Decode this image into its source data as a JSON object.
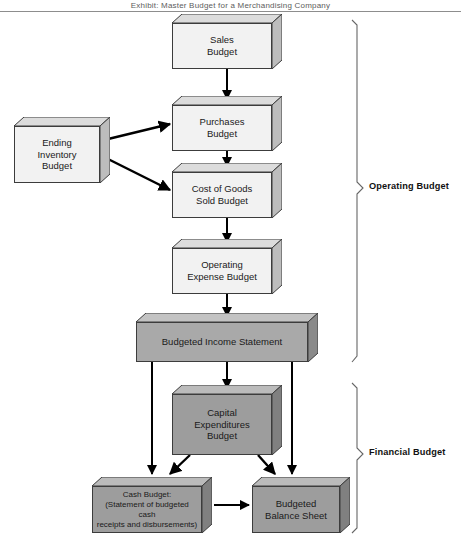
{
  "page": {
    "running_header": "Exhibit: Master Budget for a Merchandising Company"
  },
  "diagram": {
    "nodes": [
      {
        "id": "sales",
        "label": "Sales\nBudget",
        "lines": [
          "Sales",
          "Budget"
        ],
        "shade": "light",
        "x": 172,
        "y": 14,
        "w": 110,
        "h": 55
      },
      {
        "id": "purchases",
        "label": "Purchases\nBudget",
        "lines": [
          "Purchases",
          "Budget"
        ],
        "shade": "light",
        "x": 172,
        "y": 96,
        "w": 110,
        "h": 55
      },
      {
        "id": "ending_inv",
        "label": "Ending\nInventory\nBudget",
        "lines": [
          "Ending",
          "Inventory",
          "Budget"
        ],
        "shade": "light",
        "x": 14,
        "y": 117,
        "w": 96,
        "h": 66
      },
      {
        "id": "cogs",
        "label": "Cost of Goods\nSold Budget",
        "lines": [
          "Cost of Goods",
          "Sold Budget"
        ],
        "shade": "light",
        "x": 172,
        "y": 163,
        "w": 110,
        "h": 55
      },
      {
        "id": "op_expense",
        "label": "Operating\nExpense Budget",
        "lines": [
          "Operating",
          "Expense Budget"
        ],
        "shade": "light",
        "x": 172,
        "y": 239,
        "w": 110,
        "h": 55
      },
      {
        "id": "income_stmt",
        "label": "Budgeted Income Statement",
        "lines": [
          "Budgeted Income Statement"
        ],
        "shade": "mid",
        "x": 136,
        "y": 313,
        "w": 182,
        "h": 49
      },
      {
        "id": "capital_exp",
        "label": "Capital\nExpenditures\nBudget",
        "lines": [
          "Capital",
          "Expenditures",
          "Budget"
        ],
        "shade": "dark",
        "x": 172,
        "y": 385,
        "w": 110,
        "h": 70
      },
      {
        "id": "cash_budget",
        "label": "Cash Budget:\n(Statement of budgeted cash\nreceipts and disbursements)",
        "lines": [
          "Cash Budget:",
          "(Statement of budgeted cash",
          "receipts and disbursements)"
        ],
        "shade": "dark",
        "x": 92,
        "y": 477,
        "w": 120,
        "h": 56
      },
      {
        "id": "balance_sheet",
        "label": "Budgeted\nBalance Sheet",
        "lines": [
          "Budgeted",
          "Balance Sheet"
        ],
        "shade": "dark",
        "x": 252,
        "y": 477,
        "w": 98,
        "h": 56
      }
    ],
    "edges": [
      {
        "id": "sales-to-purchases",
        "from": "sales",
        "to": "purchases"
      },
      {
        "id": "endinv-to-purchases",
        "from": "ending_inv",
        "to": "purchases"
      },
      {
        "id": "endinv-to-cogs",
        "from": "ending_inv",
        "to": "cogs"
      },
      {
        "id": "purchases-to-cogs",
        "from": "purchases",
        "to": "cogs"
      },
      {
        "id": "cogs-to-opexpense",
        "from": "cogs",
        "to": "op_expense"
      },
      {
        "id": "opexpense-to-income",
        "from": "op_expense",
        "to": "income_stmt"
      },
      {
        "id": "income-to-cash",
        "from": "income_stmt",
        "to": "cash_budget"
      },
      {
        "id": "income-to-capital",
        "from": "income_stmt",
        "to": "capital_exp"
      },
      {
        "id": "income-to-balance",
        "from": "income_stmt",
        "to": "balance_sheet"
      },
      {
        "id": "capital-to-cash",
        "from": "capital_exp",
        "to": "cash_budget"
      },
      {
        "id": "capital-to-balance",
        "from": "capital_exp",
        "to": "balance_sheet"
      },
      {
        "id": "cash-to-balance",
        "from": "cash_budget",
        "to": "balance_sheet"
      }
    ],
    "groups": [
      {
        "id": "operating",
        "label": "Operating Budget",
        "members": [
          "sales",
          "purchases",
          "ending_inv",
          "cogs",
          "op_expense",
          "income_stmt"
        ],
        "top": 20,
        "bottom": 362
      },
      {
        "id": "financial",
        "label": "Financial Budget",
        "members": [
          "capital_exp",
          "cash_budget",
          "balance_sheet"
        ],
        "top": 383,
        "bottom": 533
      }
    ]
  },
  "colors": {
    "box_light": "#f2f2f2",
    "box_mid": "#a9a9a9",
    "box_dark": "#9d9d9d",
    "box_outline": "#3c3c3c",
    "arrow": "#000000",
    "bracket": "#555555",
    "background": "#ffffff"
  }
}
